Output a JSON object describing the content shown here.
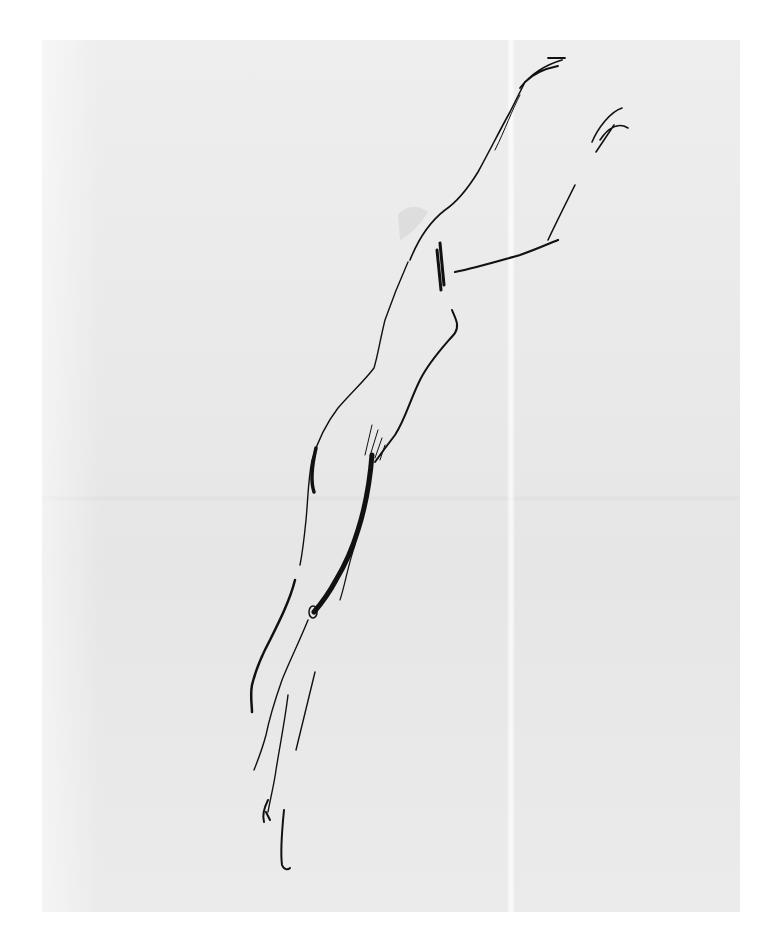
{
  "artwork": {
    "subject": "ink sketch of a figure reaching upward",
    "medium": "pen and ink on paper",
    "colors": {
      "background": "#ffffff",
      "paper": "#e9e9e9",
      "ink": "#111111"
    },
    "signature": ""
  }
}
